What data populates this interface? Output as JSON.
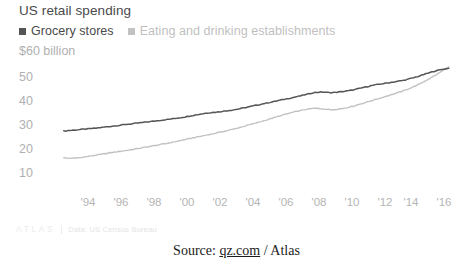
{
  "chart": {
    "title": "US retail spending",
    "y_axis_unit": "$60 billion",
    "legend": [
      {
        "label": "Grocery stores",
        "color": "#555555",
        "swatch": "square-swatch"
      },
      {
        "label": "Eating and drinking establishments",
        "color": "#c2c2c2",
        "swatch": "square-swatch"
      }
    ],
    "credit": {
      "wordmark": "ATLAS",
      "data_source": "Data: US Census Bureau"
    }
  },
  "source_line": {
    "prefix": "Source: ",
    "link": "qz.com",
    "suffix": " / Atlas"
  },
  "chart_data": {
    "type": "line",
    "title": "US retail spending",
    "xlabel": "",
    "ylabel": "$60 billion",
    "ylim": [
      5,
      60
    ],
    "xlim": [
      1992.5,
      2016.5
    ],
    "grid": false,
    "legend_position": "top-left",
    "y_ticks": [
      "$60 billion",
      "50",
      "40",
      "30",
      "20",
      "10"
    ],
    "y_tick_values": [
      60,
      50,
      40,
      30,
      20,
      10
    ],
    "x_ticks": [
      "'94",
      "'96",
      "'98",
      "'00",
      "'02",
      "'04",
      "'06",
      "'08",
      "'10",
      "'12",
      "'14",
      "'16"
    ],
    "x_tick_values": [
      1994,
      1996,
      1998,
      2000,
      2002,
      2004,
      2006,
      2008,
      2010,
      2012,
      2014,
      2016
    ],
    "x": [
      1992.5,
      1993,
      1993.5,
      1994,
      1994.5,
      1995,
      1995.5,
      1996,
      1996.5,
      1997,
      1997.5,
      1998,
      1998.5,
      1999,
      1999.5,
      2000,
      2000.5,
      2001,
      2001.5,
      2002,
      2002.5,
      2003,
      2003.5,
      2004,
      2004.5,
      2005,
      2005.5,
      2006,
      2006.5,
      2007,
      2007.5,
      2008,
      2008.5,
      2009,
      2009.5,
      2010,
      2010.5,
      2011,
      2011.5,
      2012,
      2012.5,
      2013,
      2013.5,
      2014,
      2014.5,
      2015,
      2015.5,
      2016,
      2016.3
    ],
    "series": [
      {
        "name": "Grocery stores",
        "color": "#555555",
        "values": [
          27.2,
          27.5,
          27.8,
          28.1,
          28.4,
          28.8,
          29.2,
          29.6,
          30.0,
          30.4,
          30.8,
          31.2,
          31.6,
          32.0,
          32.5,
          33.0,
          33.6,
          34.2,
          34.7,
          35.0,
          35.4,
          35.9,
          36.5,
          37.2,
          37.9,
          38.6,
          39.3,
          40.0,
          40.7,
          41.4,
          42.2,
          43.0,
          43.2,
          42.9,
          43.2,
          43.6,
          44.2,
          45.0,
          45.8,
          46.4,
          46.9,
          47.4,
          48.0,
          48.8,
          49.8,
          50.9,
          51.9,
          52.6,
          52.9
        ]
      },
      {
        "name": "Eating and drinking establishments",
        "color": "#c2c2c2",
        "values": [
          16.2,
          16.0,
          16.3,
          16.8,
          17.3,
          17.9,
          18.4,
          18.9,
          19.4,
          19.9,
          20.5,
          21.1,
          21.7,
          22.3,
          23.0,
          23.7,
          24.4,
          25.1,
          25.8,
          26.5,
          27.2,
          28.0,
          28.9,
          29.8,
          30.7,
          31.7,
          32.7,
          33.7,
          34.6,
          35.4,
          36.1,
          36.5,
          36.3,
          35.9,
          36.2,
          36.8,
          37.6,
          38.6,
          39.6,
          40.6,
          41.6,
          42.6,
          43.7,
          45.0,
          46.5,
          48.3,
          50.2,
          52.3,
          53.5
        ]
      }
    ]
  }
}
